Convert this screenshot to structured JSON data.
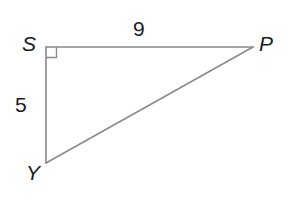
{
  "figure": {
    "kind": "right-triangle",
    "canvas": {
      "width": 287,
      "height": 204,
      "background": "#ffffff"
    },
    "stroke_color": "#8a8a8a",
    "label_color": "#1b1b1b"
  },
  "vertices": [
    {
      "id": "S",
      "label": "S",
      "x": 46,
      "y": 47,
      "right_angle": true
    },
    {
      "id": "P",
      "label": "P",
      "x": 253,
      "y": 47,
      "right_angle": false
    },
    {
      "id": "Y",
      "label": "Y",
      "x": 46,
      "y": 163,
      "right_angle": false
    }
  ],
  "sides": [
    {
      "id": "SP",
      "from": "S",
      "to": "P",
      "length_label": "9"
    },
    {
      "id": "SY",
      "from": "S",
      "to": "Y",
      "length_label": "5"
    },
    {
      "id": "YP",
      "from": "Y",
      "to": "P",
      "length_label": ""
    }
  ],
  "markers": {
    "right_angle": {
      "at": "S",
      "size": 10,
      "label": "right-angle-square"
    }
  }
}
